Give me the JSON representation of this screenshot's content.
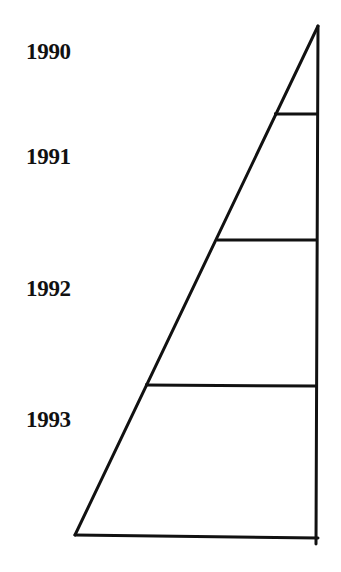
{
  "diagram": {
    "type": "stacked-triangle-segments",
    "stroke_color": "#111111",
    "background": "#ffffff",
    "labels": [
      {
        "text": "1990",
        "top": 40
      },
      {
        "text": "1991",
        "top": 145
      },
      {
        "text": "1992",
        "top": 277
      },
      {
        "text": "1993",
        "top": 408
      }
    ],
    "segments": [
      {
        "year": "1990",
        "from_y": 26,
        "to_y": 114
      },
      {
        "year": "1991",
        "from_y": 114,
        "to_y": 240
      },
      {
        "year": "1992",
        "from_y": 240,
        "to_y": 385
      },
      {
        "year": "1993",
        "from_y": 385,
        "to_y": 537
      }
    ]
  }
}
